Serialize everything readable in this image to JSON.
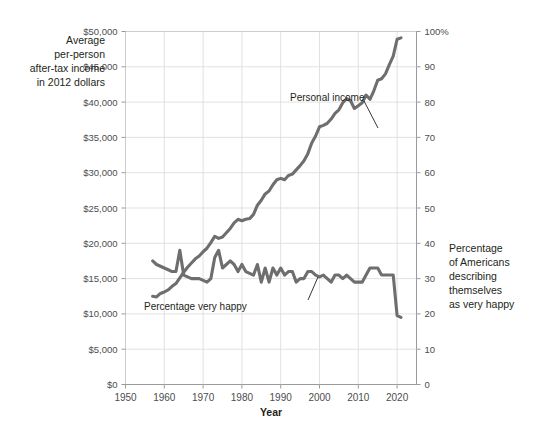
{
  "chart_data": {
    "type": "line",
    "title": "",
    "xlabel": "Year",
    "grid": true,
    "legend_position": "inline-annotations",
    "x_axis": {
      "label": "Year",
      "min": 1950,
      "max": 2025,
      "ticks": [
        1950,
        1960,
        1970,
        1980,
        1990,
        2000,
        2010,
        2020
      ],
      "tick_labels": [
        "1950",
        "1960",
        "1970",
        "1980",
        "1990",
        "2000",
        "2010",
        "2020"
      ]
    },
    "y_axis_left": {
      "label": "Average per-person after-tax income in 2012 dollars",
      "label_lines": [
        "Average",
        "per-person",
        "after-tax income",
        "in 2012 dollars"
      ],
      "min": 0,
      "max": 50000,
      "ticks": [
        0,
        5000,
        10000,
        15000,
        20000,
        25000,
        30000,
        35000,
        40000,
        45000,
        50000
      ],
      "tick_labels": [
        "$0",
        "$5,000",
        "$10,000",
        "$15,000",
        "$20,000",
        "$25,000",
        "$30,000",
        "$35,000",
        "$40,000",
        "$45,000",
        "$50,000"
      ]
    },
    "y_axis_right": {
      "label": "Percentage of Americans describing themselves as very happy",
      "label_lines": [
        "Percentage",
        "of Americans",
        "describing",
        "themselves",
        "as very happy"
      ],
      "min": 0,
      "max": 100,
      "ticks": [
        0,
        10,
        20,
        30,
        40,
        50,
        60,
        70,
        80,
        90,
        100
      ],
      "tick_labels": [
        "0",
        "10",
        "20",
        "30",
        "40",
        "50",
        "60",
        "70",
        "80",
        "90",
        "100%"
      ]
    },
    "series": [
      {
        "name": "Personal income",
        "annotation": "Personal income",
        "axis": "left",
        "units": "2012 dollars",
        "color": "#6e6e6e",
        "x": [
          1957,
          1958,
          1959,
          1960,
          1961,
          1962,
          1963,
          1964,
          1965,
          1966,
          1967,
          1968,
          1969,
          1970,
          1971,
          1972,
          1973,
          1974,
          1975,
          1976,
          1977,
          1978,
          1979,
          1980,
          1981,
          1982,
          1983,
          1984,
          1985,
          1986,
          1987,
          1988,
          1989,
          1990,
          1991,
          1992,
          1993,
          1994,
          1995,
          1996,
          1997,
          1998,
          1999,
          2000,
          2001,
          2002,
          2003,
          2004,
          2005,
          2006,
          2007,
          2008,
          2009,
          2010,
          2011,
          2012,
          2013,
          2014,
          2015,
          2016,
          2017,
          2018,
          2019,
          2020,
          2021
        ],
        "y": [
          12500,
          12400,
          12900,
          13100,
          13400,
          13900,
          14300,
          15100,
          15900,
          16600,
          17200,
          17800,
          18200,
          18800,
          19300,
          20100,
          21000,
          20700,
          20900,
          21500,
          22100,
          22900,
          23400,
          23200,
          23400,
          23500,
          24100,
          25400,
          26100,
          27000,
          27400,
          28300,
          29000,
          29200,
          29000,
          29600,
          29800,
          30400,
          31000,
          31700,
          32700,
          34200,
          35200,
          36500,
          36700,
          37000,
          37600,
          38400,
          38900,
          39900,
          40500,
          40200,
          39100,
          39500,
          39900,
          41000,
          40400,
          41600,
          43100,
          43300,
          44000,
          45300,
          46500,
          48900,
          49100
        ]
      },
      {
        "name": "Percentage very happy",
        "annotation": "Percentage very happy",
        "axis": "right",
        "units": "percent",
        "color": "#6e6e6e",
        "x": [
          1957,
          1958,
          1959,
          1960,
          1961,
          1962,
          1963,
          1964,
          1965,
          1966,
          1967,
          1968,
          1969,
          1970,
          1971,
          1972,
          1973,
          1974,
          1975,
          1976,
          1977,
          1978,
          1979,
          1980,
          1981,
          1982,
          1983,
          1984,
          1985,
          1986,
          1987,
          1988,
          1989,
          1990,
          1991,
          1992,
          1993,
          1994,
          1995,
          1996,
          1997,
          1998,
          1999,
          2000,
          2001,
          2002,
          2003,
          2004,
          2005,
          2006,
          2007,
          2008,
          2009,
          2010,
          2011,
          2012,
          2013,
          2014,
          2015,
          2016,
          2017,
          2018,
          2019,
          2020,
          2021
        ],
        "y": [
          35,
          34,
          33.5,
          33,
          32.5,
          32,
          32,
          38,
          31,
          30.5,
          30,
          30,
          30,
          29.5,
          29,
          30,
          36,
          38,
          33,
          34,
          35,
          34,
          32,
          34,
          32,
          31.5,
          31,
          34,
          29,
          33,
          29,
          33,
          31,
          33,
          31,
          32,
          32,
          29,
          30,
          30,
          32,
          32,
          31,
          30.5,
          31,
          30,
          29,
          31,
          31,
          30,
          31,
          30,
          29,
          29,
          29,
          31,
          33,
          33,
          33,
          31,
          31,
          31,
          31,
          19.5,
          19
        ]
      }
    ],
    "annotations": [
      {
        "text": "Personal income",
        "target_series": "Personal income",
        "x_px": 322,
        "y_px": 97
      },
      {
        "text": "Percentage very happy",
        "target_series": "Percentage very happy",
        "x_px": 253,
        "y_px": 306
      }
    ]
  },
  "colors": {
    "line": "#6e6e6e",
    "grid": "#d9d9d9",
    "frame": "#9a9a9a",
    "text": "#231f20",
    "tick_text": "#4d4d4d",
    "background": "#ffffff"
  }
}
